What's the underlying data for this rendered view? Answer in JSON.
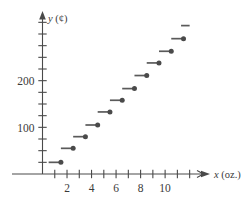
{
  "figure": {
    "name": "postage-step-function-graph",
    "background_color": "#ffffff",
    "ink_color": "#4a4a4a"
  },
  "axes": {
    "y_axis_title": "y (¢)",
    "x_axis_title": "x (oz.)",
    "y_tick_labels": [
      "100",
      "200"
    ],
    "x_tick_labels": [
      "2",
      "4",
      "6",
      "8",
      "10"
    ]
  },
  "chart_data": {
    "type": "line",
    "subtype": "step-function",
    "title": "",
    "xlabel": "x (oz.)",
    "ylabel": "y (¢)",
    "xlim": [
      0,
      12.6
    ],
    "ylim": [
      0,
      330
    ],
    "grid": false,
    "legend": null,
    "x_ticks": [
      1,
      2,
      3,
      4,
      5,
      6,
      7,
      8,
      9,
      10,
      11,
      12
    ],
    "x_tick_labels_shown": {
      "2": "2",
      "4": "4",
      "6": "6",
      "8": "8",
      "10": "10"
    },
    "y_ticks": [
      25,
      50,
      75,
      100,
      125,
      150,
      175,
      200,
      225,
      250,
      275,
      300,
      325
    ],
    "y_tick_labels_shown": {
      "100": "100",
      "200": "200"
    },
    "endpoint_convention": "closed on right (filled dot), open on left",
    "steps": [
      {
        "x_start": 0.5,
        "x_end": 1.5,
        "y": 25,
        "dot": true
      },
      {
        "x_start": 1.5,
        "x_end": 2.5,
        "y": 55,
        "dot": true
      },
      {
        "x_start": 2.5,
        "x_end": 3.5,
        "y": 80,
        "dot": true
      },
      {
        "x_start": 3.5,
        "x_end": 4.5,
        "y": 105,
        "dot": true
      },
      {
        "x_start": 4.5,
        "x_end": 5.5,
        "y": 133,
        "dot": true
      },
      {
        "x_start": 5.5,
        "x_end": 6.5,
        "y": 158,
        "dot": true
      },
      {
        "x_start": 6.5,
        "x_end": 7.5,
        "y": 183,
        "dot": true
      },
      {
        "x_start": 7.5,
        "x_end": 8.5,
        "y": 211,
        "dot": true
      },
      {
        "x_start": 8.5,
        "x_end": 9.5,
        "y": 238,
        "dot": true
      },
      {
        "x_start": 9.5,
        "x_end": 10.5,
        "y": 263,
        "dot": true
      },
      {
        "x_start": 10.5,
        "x_end": 11.5,
        "y": 290,
        "dot": true
      },
      {
        "x_start": 11.3,
        "x_end": 12.0,
        "y": 318,
        "dot": false
      }
    ]
  }
}
